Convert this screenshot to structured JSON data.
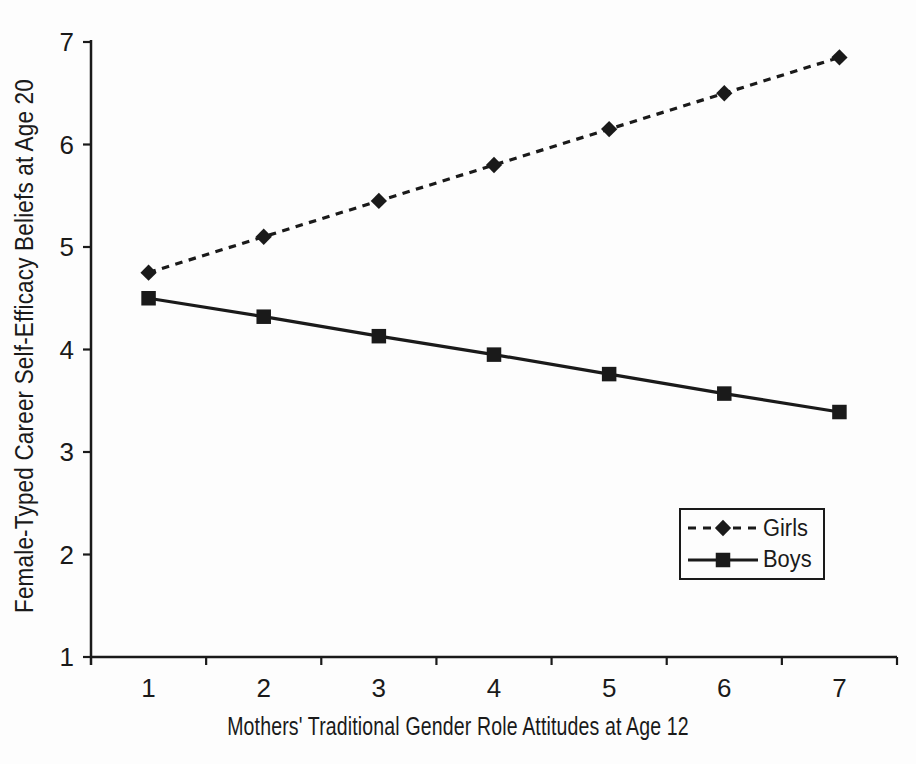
{
  "chart_data": {
    "type": "line",
    "x": [
      1,
      2,
      3,
      4,
      5,
      6,
      7
    ],
    "x_ticks": [
      "1",
      "2",
      "3",
      "4",
      "5",
      "6",
      "7"
    ],
    "y_ticks": [
      "1",
      "2",
      "3",
      "4",
      "5",
      "6",
      "7"
    ],
    "xlim": [
      0.5,
      7.5
    ],
    "ylim": [
      1,
      7
    ],
    "grid": false,
    "xlabel": "Mothers' Traditional Gender Role Attitudes at Age 12",
    "ylabel": "Female-Typed Career Self-Efficacy Beliefs at Age 20",
    "series": [
      {
        "name": "Girls",
        "marker": "diamond",
        "line_style": "dashed",
        "values": [
          4.75,
          5.1,
          5.45,
          5.8,
          6.15,
          6.5,
          6.85
        ]
      },
      {
        "name": "Boys",
        "marker": "square",
        "line_style": "solid",
        "values": [
          4.5,
          4.32,
          4.13,
          3.95,
          3.76,
          3.57,
          3.39
        ]
      }
    ],
    "legend": {
      "position": "lower-right",
      "entries": [
        "Girls",
        "Boys"
      ]
    },
    "colors": {
      "ink": "#1a1a1a",
      "background": "#fdfdfd"
    }
  }
}
